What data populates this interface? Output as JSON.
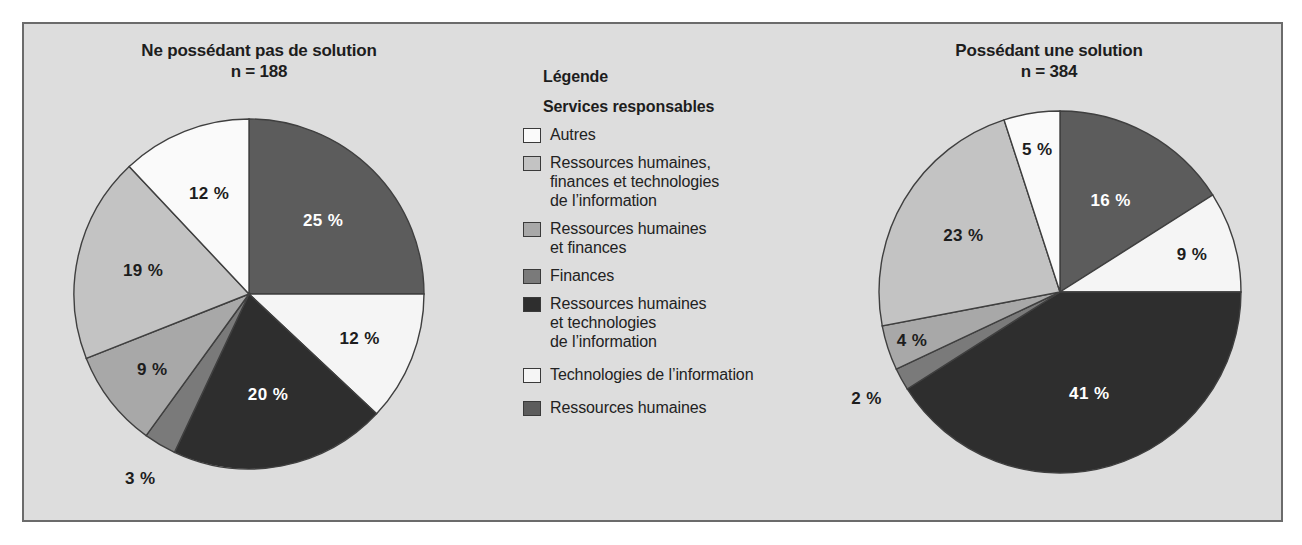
{
  "figure": {
    "background_color": "#dddddd",
    "border_color": "#6b6b6b"
  },
  "legend": {
    "heading": "Légende",
    "subheading": "Services responsables",
    "items": [
      {
        "label": "Autres",
        "color": "#fafafa"
      },
      {
        "label": "Ressources humaines,\nfinances et technologies\nde l’information",
        "color": "#c3c3c3"
      },
      {
        "label": "Ressources humaines\net finances",
        "color": "#a8a8a8"
      },
      {
        "label": "Finances",
        "color": "#7a7a7a"
      },
      {
        "label": "Ressources humaines\net technologies\nde l’information",
        "color": "#2e2e2e"
      },
      {
        "label": "Technologies de l’information",
        "color": "#f5f5f5"
      },
      {
        "label": "Ressources humaines",
        "color": "#5c5c5c"
      }
    ]
  },
  "chart_data": [
    {
      "type": "pie",
      "title": "Ne possédant pas de solution",
      "subtitle": "n = 188",
      "sample_size": 188,
      "units": "%",
      "categories": [
        "Ressources humaines",
        "Technologies de l’information",
        "Ressources humaines et technologies de l’information",
        "Finances",
        "Ressources humaines et finances",
        "Ressources humaines, finances et technologies de l’information",
        "Autres"
      ],
      "values": [
        25,
        12,
        20,
        3,
        9,
        19,
        12
      ],
      "labels": [
        "25 %",
        "12 %",
        "20 %",
        "3 %",
        "9 %",
        "19 %",
        "12 %"
      ],
      "colors": [
        "#5c5c5c",
        "#f5f5f5",
        "#2e2e2e",
        "#7a7a7a",
        "#a8a8a8",
        "#c3c3c3",
        "#fafafa"
      ],
      "label_colors": [
        "#ffffff",
        "#1d1d1d",
        "#ffffff",
        "#1d1d1d",
        "#1d1d1d",
        "#1d1d1d",
        "#1d1d1d"
      ],
      "start_angle_deg": 0,
      "direction": "clockwise",
      "legend_position": "center"
    },
    {
      "type": "pie",
      "title": "Possédant une solution",
      "subtitle": "n = 384",
      "sample_size": 384,
      "units": "%",
      "categories": [
        "Ressources humaines",
        "Technologies de l’information",
        "Ressources humaines et technologies de l’information",
        "Finances",
        "Ressources humaines et finances",
        "Ressources humaines, finances et technologies de l’information",
        "Autres"
      ],
      "values": [
        16,
        9,
        41,
        2,
        4,
        23,
        5
      ],
      "labels": [
        "16 %",
        "9 %",
        "41 %",
        "2 %",
        "4 %",
        "23 %",
        "5 %"
      ],
      "colors": [
        "#5c5c5c",
        "#f5f5f5",
        "#2e2e2e",
        "#7a7a7a",
        "#a8a8a8",
        "#c3c3c3",
        "#fafafa"
      ],
      "label_colors": [
        "#ffffff",
        "#1d1d1d",
        "#ffffff",
        "#1d1d1d",
        "#1d1d1d",
        "#1d1d1d",
        "#1d1d1d"
      ],
      "start_angle_deg": 0,
      "direction": "clockwise",
      "legend_position": "center"
    }
  ]
}
